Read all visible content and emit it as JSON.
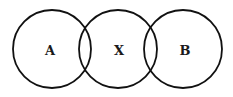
{
  "diagram": {
    "type": "three overlapping circles",
    "circles": [
      {
        "label": "A",
        "cx": 52,
        "cy": 49,
        "r": 39
      },
      {
        "label": "X",
        "cx": 118,
        "cy": 49,
        "r": 39
      },
      {
        "label": "B",
        "cx": 183,
        "cy": 49,
        "r": 39
      }
    ],
    "stroke_color": "#111111",
    "background": "#ffffff"
  }
}
